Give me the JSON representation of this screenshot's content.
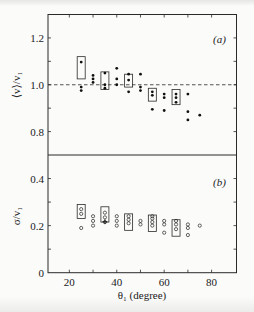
{
  "chart_data": [
    {
      "id": "a",
      "type": "scatter",
      "panel_label": "(a)",
      "ylabel": "⟨v⟩/v₁",
      "xlabel": "θ₁ (degree)",
      "xlim": [
        11,
        90.5
      ],
      "ylim": [
        0.7,
        1.3
      ],
      "yticks": [
        0.8,
        1.0,
        1.2
      ],
      "yticks_minor": [
        0.9,
        1.1
      ],
      "xticks": [
        20,
        30,
        40,
        50,
        60,
        70,
        80
      ],
      "reference_line": {
        "y": 1.0,
        "style": "dashed"
      },
      "marker": "filled-dot",
      "points": [
        {
          "x": 25,
          "y": 1.097
        },
        {
          "x": 25,
          "y": 0.99
        },
        {
          "x": 25,
          "y": 0.975
        },
        {
          "x": 30,
          "y": 1.04
        },
        {
          "x": 30,
          "y": 1.025
        },
        {
          "x": 30,
          "y": 1.01
        },
        {
          "x": 35,
          "y": 1.05
        },
        {
          "x": 35,
          "y": 1.0
        },
        {
          "x": 35,
          "y": 0.985
        },
        {
          "x": 40,
          "y": 1.07
        },
        {
          "x": 40,
          "y": 1.025
        },
        {
          "x": 40,
          "y": 1.0
        },
        {
          "x": 45,
          "y": 1.045
        },
        {
          "x": 45,
          "y": 1.02
        },
        {
          "x": 45,
          "y": 0.97
        },
        {
          "x": 50,
          "y": 1.045
        },
        {
          "x": 50,
          "y": 0.99
        },
        {
          "x": 50,
          "y": 0.975
        },
        {
          "x": 55,
          "y": 0.97
        },
        {
          "x": 55,
          "y": 0.955
        },
        {
          "x": 55,
          "y": 0.895
        },
        {
          "x": 60,
          "y": 0.96
        },
        {
          "x": 60,
          "y": 0.945
        },
        {
          "x": 60,
          "y": 0.89
        },
        {
          "x": 65,
          "y": 0.96
        },
        {
          "x": 65,
          "y": 0.945
        },
        {
          "x": 65,
          "y": 0.925
        },
        {
          "x": 70,
          "y": 0.96
        },
        {
          "x": 70,
          "y": 0.885
        },
        {
          "x": 70,
          "y": 0.85
        },
        {
          "x": 75,
          "y": 0.87
        }
      ],
      "boxes": [
        {
          "x": 25,
          "y_low": 1.025,
          "y_high": 1.12
        },
        {
          "x": 35,
          "y_low": 0.98,
          "y_high": 1.055
        },
        {
          "x": 45,
          "y_low": 0.99,
          "y_high": 1.045
        },
        {
          "x": 55,
          "y_low": 0.93,
          "y_high": 0.985
        },
        {
          "x": 65,
          "y_low": 0.915,
          "y_high": 0.98
        }
      ]
    },
    {
      "id": "b",
      "type": "scatter",
      "panel_label": "(b)",
      "ylabel": "σ/v₁",
      "xlabel": "θ₁ (degree)",
      "xlim": [
        11,
        90.5
      ],
      "ylim": [
        0,
        0.5
      ],
      "yticks": [
        0,
        0.2,
        0.4
      ],
      "yticks_minor": [
        0.1,
        0.3
      ],
      "xticks": [
        20,
        40,
        60,
        80
      ],
      "xticks_minor": [
        30,
        50,
        70
      ],
      "marker": "open-circle",
      "points": [
        {
          "x": 25,
          "y": 0.27
        },
        {
          "x": 25,
          "y": 0.25
        },
        {
          "x": 25,
          "y": 0.19
        },
        {
          "x": 30,
          "y": 0.24
        },
        {
          "x": 30,
          "y": 0.22
        },
        {
          "x": 30,
          "y": 0.2
        },
        {
          "x": 35,
          "y": 0.255
        },
        {
          "x": 35,
          "y": 0.235
        },
        {
          "x": 35,
          "y": 0.215
        },
        {
          "x": 40,
          "y": 0.24
        },
        {
          "x": 40,
          "y": 0.22
        },
        {
          "x": 40,
          "y": 0.2
        },
        {
          "x": 45,
          "y": 0.24
        },
        {
          "x": 45,
          "y": 0.225
        },
        {
          "x": 45,
          "y": 0.21
        },
        {
          "x": 50,
          "y": 0.22
        },
        {
          "x": 50,
          "y": 0.205
        },
        {
          "x": 55,
          "y": 0.24
        },
        {
          "x": 55,
          "y": 0.23
        },
        {
          "x": 55,
          "y": 0.215
        },
        {
          "x": 55,
          "y": 0.2
        },
        {
          "x": 60,
          "y": 0.22
        },
        {
          "x": 60,
          "y": 0.205
        },
        {
          "x": 60,
          "y": 0.17
        },
        {
          "x": 65,
          "y": 0.22
        },
        {
          "x": 65,
          "y": 0.205
        },
        {
          "x": 65,
          "y": 0.185
        },
        {
          "x": 70,
          "y": 0.205
        },
        {
          "x": 70,
          "y": 0.19
        },
        {
          "x": 70,
          "y": 0.16
        },
        {
          "x": 75,
          "y": 0.2
        }
      ],
      "plus_markers": [
        {
          "x": 35,
          "y": 0.217
        }
      ],
      "boxes": [
        {
          "x": 25,
          "y_low": 0.23,
          "y_high": 0.29
        },
        {
          "x": 35,
          "y_low": 0.215,
          "y_high": 0.28
        },
        {
          "x": 45,
          "y_low": 0.18,
          "y_high": 0.25
        },
        {
          "x": 55,
          "y_low": 0.175,
          "y_high": 0.245
        },
        {
          "x": 65,
          "y_low": 0.155,
          "y_high": 0.225
        }
      ]
    }
  ],
  "labels": {
    "panel_a": "(a)",
    "panel_b": "(b)",
    "ylabel_a": "⟨v⟩/v₁",
    "ylabel_b": "σ/v₁",
    "xlabel": "θ₁ (degree)"
  }
}
